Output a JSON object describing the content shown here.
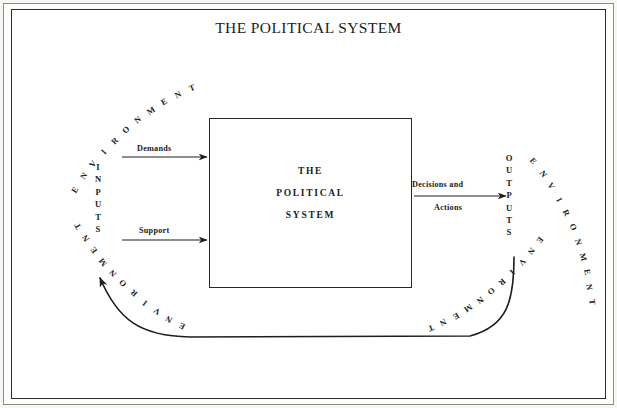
{
  "diagram": {
    "title": "THE POLITICAL SYSTEM",
    "center_box": {
      "lines": [
        "THE",
        "POLITICAL",
        "SYSTEM"
      ]
    },
    "inputs_label": "INPUTS",
    "outputs_label": "OUTPUTS",
    "input_arrows": [
      {
        "label": "Demands"
      },
      {
        "label": "Support"
      }
    ],
    "output_arrow": {
      "line1": "Decisions and",
      "line2": "Actions"
    },
    "environment_labels": [
      {
        "id": "top-left",
        "text": "ENVIRONMENT"
      },
      {
        "id": "top-right",
        "text": "ENVIRONMENT"
      },
      {
        "id": "bottom-left",
        "text": "ENVIRONMENT"
      },
      {
        "id": "bottom-right",
        "text": "ENVIRONMENT"
      }
    ],
    "feedback_loop": {
      "description": "curved feedback arrow from outputs back to inputs"
    },
    "colors": {
      "ink": "#1b1b1b",
      "line": "#262626",
      "page": "#ffffff",
      "frame_outer": "#8d8d8d",
      "scan_background": "#f7f7f5"
    }
  }
}
